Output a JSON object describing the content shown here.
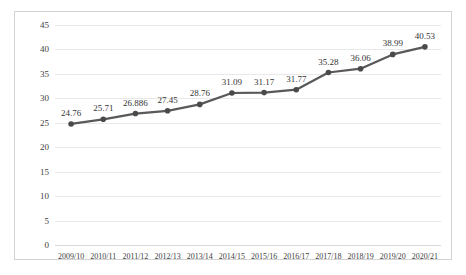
{
  "chart_data": {
    "type": "line",
    "title": "",
    "subtitle": "",
    "xlabel": "",
    "ylabel": "",
    "categories": [
      "2009/10",
      "2010/11",
      "2011/12",
      "2012/13",
      "2013/14",
      "2014/15",
      "2015/16",
      "2016/17",
      "2017/18",
      "2018/19",
      "2019/20",
      "2020/21"
    ],
    "values": [
      24.76,
      25.71,
      26.886,
      27.45,
      28.76,
      31.09,
      31.17,
      31.77,
      35.28,
      36.06,
      38.99,
      40.53
    ],
    "data_labels": [
      "24.76",
      "25.71",
      "26.886",
      "27.45",
      "28.76",
      "31.09",
      "31.17",
      "31.77",
      "35.28",
      "36.06",
      "38.99",
      "40.53"
    ],
    "ylim": [
      0,
      45
    ],
    "ytick_values": [
      0,
      5,
      10,
      15,
      20,
      25,
      30,
      35,
      40,
      45
    ],
    "ytick_labels": [
      "0",
      "5",
      "10",
      "15",
      "20",
      "25",
      "30",
      "35",
      "40",
      "45"
    ],
    "grid": true,
    "grid_axis": "y",
    "legend": false,
    "legend_position": "none",
    "series_name": "",
    "line_color": "#595959",
    "marker_color": "#4a4a4a",
    "marker_shape": "circle",
    "gridline_color": "#e8e8e8",
    "border_color": "#d3d3d3",
    "background_color": "#ffffff",
    "text_color": "#404040"
  }
}
